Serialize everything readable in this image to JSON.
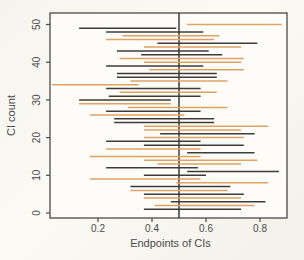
{
  "figure_title": "",
  "chart_data": {
    "type": "line",
    "subtype": "confidence-interval-segments",
    "title": "",
    "xlabel": "Endpoints of CIs",
    "ylabel": "CI count",
    "xlim": [
      0.02,
      0.9
    ],
    "ylim": [
      0,
      50
    ],
    "x_ticks": [
      0.2,
      0.4,
      0.6,
      0.8
    ],
    "x_tick_labels": [
      "0.2",
      "0.4",
      "0.6",
      "0.8"
    ],
    "y_ticks": [
      0,
      10,
      20,
      30,
      40,
      50
    ],
    "y_tick_labels": [
      "0",
      "10",
      "20",
      "30",
      "40",
      "50"
    ],
    "reference_line_x": 0.5,
    "grid": "off",
    "legend": "none",
    "colors": {
      "black_series": "#3d3c3a",
      "orange_series": "#e0a263",
      "reference_line": "#2e2d2b",
      "axis": "#4a4a48",
      "plot_background": "#fdfcf8"
    },
    "intervals": [
      {
        "count": 1,
        "lower": 0.37,
        "upper": 0.73,
        "color": "black"
      },
      {
        "count": 2,
        "lower": 0.41,
        "upper": 0.78,
        "color": "orange"
      },
      {
        "count": 3,
        "lower": 0.47,
        "upper": 0.82,
        "color": "black"
      },
      {
        "count": 4,
        "lower": 0.37,
        "upper": 0.73,
        "color": "orange"
      },
      {
        "count": 5,
        "lower": 0.37,
        "upper": 0.74,
        "color": "black"
      },
      {
        "count": 6,
        "lower": 0.32,
        "upper": 0.68,
        "color": "orange"
      },
      {
        "count": 7,
        "lower": 0.32,
        "upper": 0.69,
        "color": "black"
      },
      {
        "count": 8,
        "lower": 0.49,
        "upper": 0.83,
        "color": "orange"
      },
      {
        "count": 9,
        "lower": 0.17,
        "upper": 0.58,
        "color": "orange"
      },
      {
        "count": 10,
        "lower": 0.37,
        "upper": 0.6,
        "color": "black"
      },
      {
        "count": 11,
        "lower": 0.53,
        "upper": 0.87,
        "color": "black"
      },
      {
        "count": 12,
        "lower": 0.23,
        "upper": 0.57,
        "color": "black"
      },
      {
        "count": 13,
        "lower": 0.42,
        "upper": 0.73,
        "color": "orange"
      },
      {
        "count": 14,
        "lower": 0.37,
        "upper": 0.79,
        "color": "orange"
      },
      {
        "count": 15,
        "lower": 0.17,
        "upper": 0.58,
        "color": "orange"
      },
      {
        "count": 16,
        "lower": 0.53,
        "upper": 0.78,
        "color": "black"
      },
      {
        "count": 17,
        "lower": 0.23,
        "upper": 0.58,
        "color": "orange"
      },
      {
        "count": 18,
        "lower": 0.37,
        "upper": 0.74,
        "color": "black"
      },
      {
        "count": 19,
        "lower": 0.23,
        "upper": 0.58,
        "color": "black"
      },
      {
        "count": 20,
        "lower": 0.37,
        "upper": 0.74,
        "color": "orange"
      },
      {
        "count": 21,
        "lower": 0.43,
        "upper": 0.78,
        "color": "black"
      },
      {
        "count": 22,
        "lower": 0.37,
        "upper": 0.73,
        "color": "orange"
      },
      {
        "count": 23,
        "lower": 0.37,
        "upper": 0.83,
        "color": "orange"
      },
      {
        "count": 24,
        "lower": 0.26,
        "upper": 0.63,
        "color": "black"
      },
      {
        "count": 25,
        "lower": 0.26,
        "upper": 0.63,
        "color": "black"
      },
      {
        "count": 26,
        "lower": 0.17,
        "upper": 0.52,
        "color": "orange"
      },
      {
        "count": 27,
        "lower": 0.23,
        "upper": 0.58,
        "color": "black"
      },
      {
        "count": 28,
        "lower": 0.31,
        "upper": 0.68,
        "color": "orange"
      },
      {
        "count": 29,
        "lower": 0.13,
        "upper": 0.47,
        "color": "orange"
      },
      {
        "count": 30,
        "lower": 0.13,
        "upper": 0.47,
        "color": "black"
      },
      {
        "count": 31,
        "lower": 0.24,
        "upper": 0.58,
        "color": "black"
      },
      {
        "count": 32,
        "lower": 0.28,
        "upper": 0.64,
        "color": "orange"
      },
      {
        "count": 33,
        "lower": 0.23,
        "upper": 0.58,
        "color": "black"
      },
      {
        "count": 34,
        "lower": 0.03,
        "upper": 0.35,
        "color": "orange"
      },
      {
        "count": 35,
        "lower": 0.32,
        "upper": 0.68,
        "color": "orange"
      },
      {
        "count": 36,
        "lower": 0.27,
        "upper": 0.64,
        "color": "black"
      },
      {
        "count": 37,
        "lower": 0.27,
        "upper": 0.64,
        "color": "black"
      },
      {
        "count": 38,
        "lower": 0.39,
        "upper": 0.74,
        "color": "orange"
      },
      {
        "count": 39,
        "lower": 0.23,
        "upper": 0.59,
        "color": "black"
      },
      {
        "count": 40,
        "lower": 0.37,
        "upper": 0.73,
        "color": "orange"
      },
      {
        "count": 41,
        "lower": 0.28,
        "upper": 0.74,
        "color": "orange"
      },
      {
        "count": 42,
        "lower": 0.36,
        "upper": 0.66,
        "color": "black"
      },
      {
        "count": 43,
        "lower": 0.27,
        "upper": 0.61,
        "color": "black"
      },
      {
        "count": 44,
        "lower": 0.37,
        "upper": 0.73,
        "color": "orange"
      },
      {
        "count": 45,
        "lower": 0.42,
        "upper": 0.79,
        "color": "black"
      },
      {
        "count": 46,
        "lower": 0.23,
        "upper": 0.63,
        "color": "orange"
      },
      {
        "count": 47,
        "lower": 0.29,
        "upper": 0.65,
        "color": "orange"
      },
      {
        "count": 48,
        "lower": 0.23,
        "upper": 0.59,
        "color": "black"
      },
      {
        "count": 49,
        "lower": 0.13,
        "upper": 0.49,
        "color": "black"
      },
      {
        "count": 50,
        "lower": 0.53,
        "upper": 0.88,
        "color": "orange"
      }
    ]
  }
}
